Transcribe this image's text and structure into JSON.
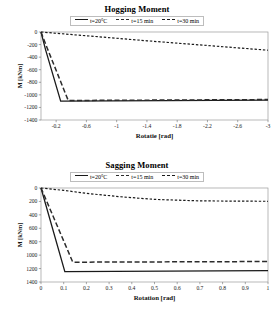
{
  "charts": {
    "top": {
      "title": "Hogging Moment",
      "legend": [
        {
          "label": "t=20°C",
          "style": "solid"
        },
        {
          "label": "t=15 min",
          "style": "dashed"
        },
        {
          "label": "t=30 min",
          "style": "dotted"
        }
      ],
      "ylabel": "M [kNm]",
      "xlabel": "Rotatie [rad]",
      "xticks": [
        "-0.2",
        "-0.6",
        "-1",
        "-1.4",
        "-1.8",
        "-2.2",
        "-2.6",
        "-3"
      ],
      "yticks": [
        "-1400",
        "-1200",
        "-1000",
        "-800",
        "-600",
        "-400",
        "-200",
        "0"
      ]
    },
    "bottom": {
      "title": "Sagging Moment",
      "legend": [
        {
          "label": "t=20°C",
          "style": "solid"
        },
        {
          "label": "t=15 min",
          "style": "dashed"
        },
        {
          "label": "t=30 min",
          "style": "dotted"
        }
      ],
      "ylabel": "M [kNm]",
      "xlabel": "Rotation [rad]",
      "xticks": [
        "0",
        "0.1",
        "0.2",
        "0.3",
        "0.4",
        "0.5",
        "0.6",
        "0.7",
        "0.8",
        "0.9",
        "1"
      ],
      "yticks": [
        "0",
        "200",
        "400",
        "600",
        "800",
        "1000",
        "1200",
        "1400"
      ]
    }
  },
  "chart_data": [
    {
      "type": "line",
      "id": "hogging-moment",
      "title": "Hogging Moment",
      "xlabel": "Rotatie [rad]",
      "ylabel": "M [kNm]",
      "xlim": [
        0,
        -3
      ],
      "ylim": [
        0,
        -1400
      ],
      "xticks": [
        -0.2,
        -0.6,
        -1,
        -1.4,
        -1.8,
        -2.2,
        -2.6,
        -3
      ],
      "yticks": [
        0,
        -200,
        -400,
        -600,
        -800,
        -1000,
        -1200,
        -1400
      ],
      "grid": false,
      "legend_position": "top-center",
      "series": [
        {
          "name": "t=20°C",
          "style": "solid",
          "color": "#1a1a1a",
          "x": [
            0,
            -0.06,
            -0.26,
            -3
          ],
          "y": [
            0,
            -280,
            -1100,
            -1085
          ]
        },
        {
          "name": "t=15 min",
          "style": "dashed",
          "color": "#2b2b2b",
          "x": [
            0,
            -0.08,
            -0.36,
            -3
          ],
          "y": [
            0,
            -250,
            -1090,
            -1075
          ]
        },
        {
          "name": "t=30 min",
          "style": "dotted",
          "color": "#1a1a1a",
          "x": [
            0,
            -0.6,
            -1.4,
            -2.2,
            -3
          ],
          "y": [
            0,
            -60,
            -140,
            -215,
            -290
          ]
        }
      ]
    },
    {
      "type": "line",
      "id": "sagging-moment",
      "title": "Sagging Moment",
      "xlabel": "Rotation [rad]",
      "ylabel": "M [kNm]",
      "xlim": [
        0,
        1
      ],
      "ylim": [
        0,
        1400
      ],
      "xticks": [
        0,
        0.1,
        0.2,
        0.3,
        0.4,
        0.5,
        0.6,
        0.7,
        0.8,
        0.9,
        1
      ],
      "yticks": [
        0,
        200,
        400,
        600,
        800,
        1000,
        1200,
        1400
      ],
      "grid": false,
      "legend_position": "top-center",
      "series": [
        {
          "name": "t=20°C",
          "style": "solid",
          "color": "#1a1a1a",
          "x": [
            0,
            0.105,
            1
          ],
          "y": [
            0,
            1245,
            1230
          ]
        },
        {
          "name": "t=15 min",
          "style": "dashed",
          "color": "#2b2b2b",
          "x": [
            0,
            0.14,
            1
          ],
          "y": [
            0,
            1105,
            1095
          ]
        },
        {
          "name": "t=30 min",
          "style": "dotted",
          "color": "#1a1a1a",
          "x": [
            0,
            0.1,
            0.2,
            0.35,
            0.5,
            0.7,
            1
          ],
          "y": [
            0,
            35,
            80,
            130,
            170,
            192,
            198
          ]
        }
      ]
    }
  ]
}
